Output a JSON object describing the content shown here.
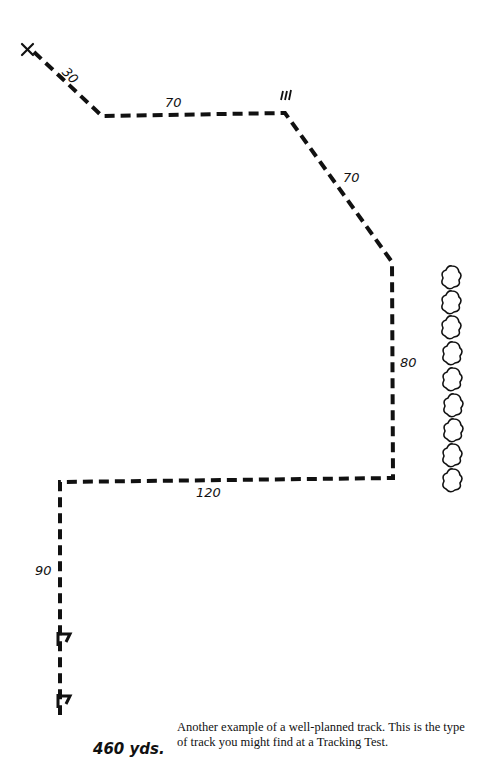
{
  "diagram": {
    "start_marker": "X",
    "segments": [
      {
        "id": "leg1",
        "label": "30"
      },
      {
        "id": "leg2",
        "label": "70"
      },
      {
        "id": "leg3",
        "label": "70"
      },
      {
        "id": "leg4",
        "label": "80"
      },
      {
        "id": "leg5",
        "label": "120"
      },
      {
        "id": "leg6",
        "label": "90"
      }
    ],
    "turn_mark": "ııı",
    "trees_count": 9,
    "total_length": "460 yds.",
    "caption": "Another example of a well-planned track. This is the type of track you might find at a Tracking Test."
  }
}
